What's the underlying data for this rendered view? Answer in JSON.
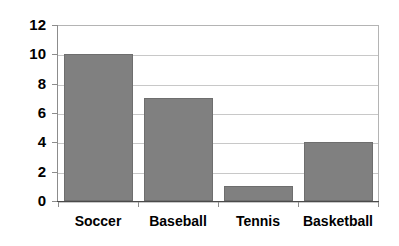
{
  "chart_data": {
    "type": "bar",
    "title": "",
    "subtitle": "",
    "xlabel": "",
    "ylabel": "",
    "categories": [
      "Soccer",
      "Baseball",
      "Tennis",
      "Basketball"
    ],
    "values": [
      10,
      7,
      1,
      4
    ],
    "series": [
      {
        "name": "",
        "values": [
          10,
          7,
          1,
          4
        ]
      }
    ],
    "ylim": [
      0,
      12
    ],
    "y_ticks": [
      0,
      2,
      4,
      6,
      8,
      10,
      12
    ],
    "y_tick_labels": [
      "0",
      "2",
      "4",
      "6",
      "8",
      "10",
      "12"
    ],
    "grid": true,
    "grid_axis": "y",
    "legend": false,
    "legend_position": "none",
    "annotations": [],
    "colors": {
      "bar_fill": "#808080",
      "bar_border": "#6e6e6e",
      "gridline": "#c8c8c8",
      "axis_line": "#8c8c8c",
      "x_axis_line": "#4a4a4a",
      "plot_border": "#b4b4b4",
      "text": "#000000",
      "background": "#ffffff"
    }
  }
}
